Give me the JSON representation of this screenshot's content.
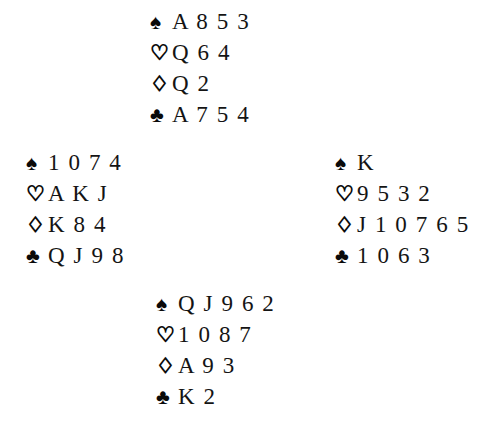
{
  "diagram": {
    "type": "bridge-deal-diagram",
    "layout": "compass",
    "suit_symbols": {
      "spades": "♠",
      "hearts": "♡",
      "diamonds": "♢",
      "clubs": "♣"
    },
    "suit_order": [
      "spades",
      "hearts",
      "diamonds",
      "clubs"
    ],
    "ink_color": "#0a0a0a",
    "background_color": "#ffffff",
    "hands": {
      "north": {
        "spades": "A 8 5 3",
        "hearts": "Q 6 4",
        "diamonds": "Q 2",
        "clubs": "A 7 5 4"
      },
      "west": {
        "spades": "1 0 7 4",
        "hearts": "A K J",
        "diamonds": "K 8 4",
        "clubs": "Q J 9 8"
      },
      "east": {
        "spades": "K",
        "hearts": "9 5 3 2",
        "diamonds": "J 1 0 7 6 5",
        "clubs": "1 0 6 3"
      },
      "south": {
        "spades": "Q J 9 6 2",
        "hearts": "1 0 8 7",
        "diamonds": "A 9 3",
        "clubs": "K 2"
      }
    }
  }
}
